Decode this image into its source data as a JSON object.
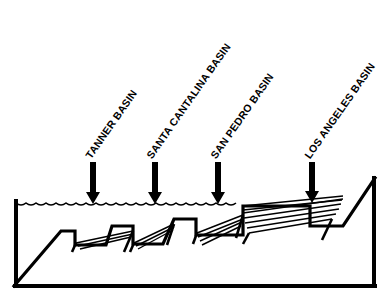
{
  "figure": {
    "type": "geologic-cross-section",
    "title": "",
    "orientation": "west-to-east",
    "stroke_color": "#000000",
    "background_color": "#ffffff",
    "frame": {
      "left": 14,
      "right": 375,
      "bottom": 286,
      "line_width": 4
    },
    "sea_surface": {
      "label": "wavy-water-line",
      "y": 203,
      "x_start": 16,
      "x_end": 243,
      "scallop_width": 10,
      "scallop_depth": 4
    },
    "labels": [
      {
        "id": "tanner",
        "text": "TANNER BASIN",
        "rotation_deg": -55,
        "anchor_x": 88,
        "anchor_y": 152
      },
      {
        "id": "santa-cantalina",
        "text": "SANTA CANTALINA BASIN",
        "rotation_deg": -55,
        "anchor_x": 149,
        "anchor_y": 152
      },
      {
        "id": "san-pedro",
        "text": "SAN PEDRO BASIN",
        "rotation_deg": -55,
        "anchor_x": 213,
        "anchor_y": 152
      },
      {
        "id": "los-angeles",
        "text": "LOS ANGELES BASIN",
        "rotation_deg": -55,
        "anchor_x": 307,
        "anchor_y": 152
      }
    ],
    "arrows": [
      {
        "id": "arrow-tanner",
        "x": 93,
        "y_top": 162,
        "y_tip": 204,
        "shaft_width": 6,
        "head_width": 14,
        "head_height": 12
      },
      {
        "id": "arrow-santa-cantalina",
        "x": 155,
        "y_top": 162,
        "y_tip": 204,
        "shaft_width": 6,
        "head_width": 14,
        "head_height": 12
      },
      {
        "id": "arrow-san-pedro",
        "x": 218,
        "y_top": 162,
        "y_tip": 204,
        "shaft_width": 6,
        "head_width": 14,
        "head_height": 12
      },
      {
        "id": "arrow-los-angeles",
        "x": 312,
        "y_top": 162,
        "y_tip": 203,
        "shaft_width": 6,
        "head_width": 14,
        "head_height": 12
      }
    ],
    "seafloor_profile": {
      "description": "Rising basement slope from lower-left with flat-topped horst ridges separated by sediment-filled basins, rising eastward to a coastal plain",
      "points": "14,286 61,231 75,231 75,245 106,245 112,226 133,226 133,244 163,244 174,219 196,219 196,235 243,235 243,206 310,206 310,226 343,226 375,178"
    },
    "basin_fills": [
      {
        "id": "fill-tanner",
        "lines": [
          "76,243 133,231",
          "78,246 133,234",
          "80,249 131,237"
        ],
        "fault_left": "76,243 72,252",
        "fault_right": "133,231 124,252"
      },
      {
        "id": "fill-santa-cantalina",
        "lines": [
          "134,243 174,224",
          "136,246 174,227",
          "138,249 173,230"
        ],
        "fault_left": "134,243 130,252",
        "fault_right": "174,224 167,245"
      },
      {
        "id": "fill-san-pedro",
        "lines": [
          "197,233 243,215",
          "198,237 243,219",
          "200,241 242,222",
          "202,245 241,226"
        ],
        "fault_left": "197,233 193,244",
        "fault_right": "243,215 236,238"
      },
      {
        "id": "fill-los-angeles",
        "lines": [
          "243,213 343,199",
          "244,218 341,204",
          "245,223 339,209",
          "247,228 336,214",
          "249,233 332,219"
        ],
        "fault_left": "249,233 243,244",
        "fault_right": "332,219 322,240"
      }
    ],
    "shelf_lines": [
      "243,206 343,196",
      "243,210 342,200"
    ]
  }
}
